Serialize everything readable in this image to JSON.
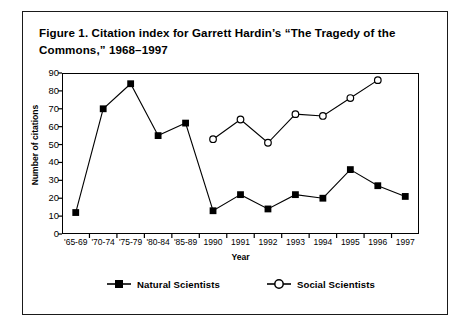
{
  "figure": {
    "title": "Figure 1. Citation index for Garrett Hardin’s “The Tragedy of the Commons,” 1968–1997"
  },
  "chart_data": {
    "type": "line",
    "title": "Figure 1. Citation index for Garrett Hardin’s “The Tragedy of the Commons,” 1968–1997",
    "xlabel": "Year",
    "ylabel": "Number of citations",
    "categories": [
      "'65-69",
      "'70-74",
      "'75-79",
      "'80-84",
      "'85-89",
      "1990",
      "1991",
      "1992",
      "1993",
      "1994",
      "1995",
      "1996",
      "1997"
    ],
    "ylim": [
      0,
      90
    ],
    "yticks": [
      0,
      10,
      20,
      30,
      40,
      50,
      60,
      70,
      80,
      90
    ],
    "grid": false,
    "legend_position": "bottom",
    "series": [
      {
        "name": "Natural Scientists",
        "marker": "filled-square",
        "color": "#000000",
        "values": [
          12,
          70,
          84,
          55,
          62,
          13,
          22,
          14,
          22,
          20,
          36,
          27,
          21
        ]
      },
      {
        "name": "Social Scientists",
        "marker": "open-circle",
        "color": "#000000",
        "values": [
          null,
          null,
          null,
          null,
          null,
          53,
          64,
          51,
          67,
          66,
          76,
          86,
          null
        ]
      }
    ]
  },
  "axes": {
    "ylabel": "Number of citations",
    "xlabel": "Year",
    "yticks": [
      "0",
      "10",
      "20",
      "30",
      "40",
      "50",
      "60",
      "70",
      "80",
      "90"
    ],
    "xticks": [
      "'65-69",
      "'70-74",
      "'75-79",
      "'80-84",
      "'85-89",
      "1990",
      "1991",
      "1992",
      "1993",
      "1994",
      "1995",
      "1996",
      "1997"
    ]
  },
  "legend": {
    "items": [
      {
        "label": "Natural Scientists",
        "marker": "filled-square"
      },
      {
        "label": "Social Scientists",
        "marker": "open-circle"
      }
    ]
  }
}
